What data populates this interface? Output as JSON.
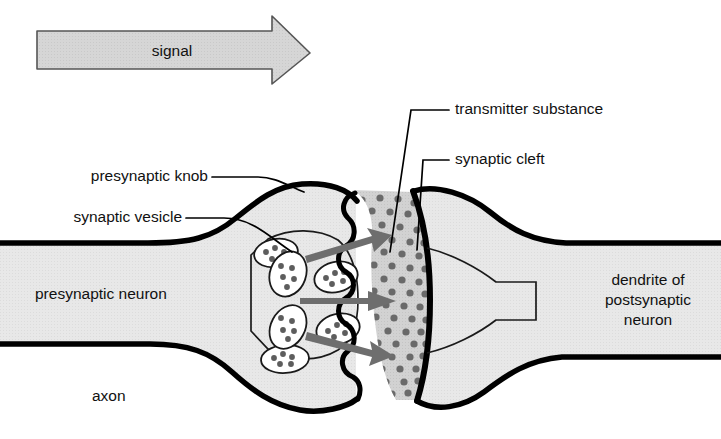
{
  "figure": {
    "title_visible": false
  },
  "signal_arrow": {
    "label": "signal",
    "direction": "left-to-right",
    "fill_color": "#d4d4d4",
    "stroke_color": "#4a4a4a"
  },
  "labels": {
    "presynaptic_knob": "presynaptic knob",
    "synaptic_vesicle": "synaptic vesicle",
    "transmitter_substance": "transmitter substance",
    "synaptic_cleft": "synaptic cleft",
    "presynaptic_neuron": "presynaptic neuron",
    "axon": "axon",
    "dendrite_line1": "dendrite of",
    "dendrite_line2": "postsynaptic",
    "dendrite_line3": "neuron"
  },
  "colors": {
    "cytoplasm_fill": "#e6e6e6",
    "cleft_fill": "#d0d0d0",
    "membrane_stroke": "#000000",
    "vesicle_fill": "#ffffff",
    "granule_fill": "#5d5d5d",
    "release_arrow_fill": "#6e6e6e",
    "background": "#ffffff",
    "text": "#111111"
  },
  "counts": {
    "synaptic_vesicles": 6,
    "release_arrows": 3,
    "membrane_scallops": 6
  }
}
